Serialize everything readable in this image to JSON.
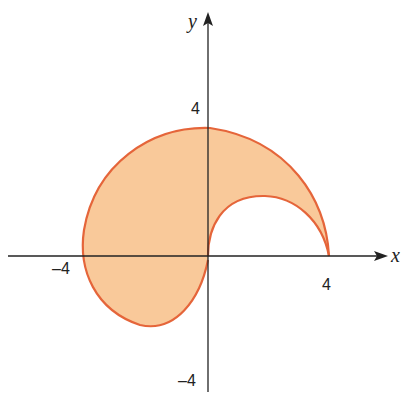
{
  "axes": {
    "x_label": "x",
    "y_label": "y",
    "ticks": {
      "x_pos": "4",
      "x_neg": "–4",
      "y_pos": "4",
      "y_neg": "–4"
    }
  },
  "colors": {
    "fill": "#f9c99a",
    "stroke": "#e5653a",
    "axis": "#222222"
  },
  "region": {
    "description": "Shaded region between two polar curves, outer spiral from (4,0) through (0,3.7), (-4,0) to origin; inner arc from origin to (4,0)",
    "outer_curve_points": [
      [
        4,
        0
      ],
      [
        3.4,
        2.2
      ],
      [
        2,
        3.3
      ],
      [
        0,
        3.7
      ],
      [
        -2,
        3.2
      ],
      [
        -3.5,
        1.8
      ],
      [
        -4,
        0
      ],
      [
        -3.7,
        -1.6
      ],
      [
        -2.2,
        -2.4
      ],
      [
        -0.8,
        -1.6
      ],
      [
        0,
        0
      ]
    ],
    "inner_curve_points": [
      [
        0,
        0
      ],
      [
        0.4,
        1.1
      ],
      [
        1.7,
        1.9
      ],
      [
        3.0,
        1.6
      ],
      [
        4,
        0
      ]
    ]
  }
}
